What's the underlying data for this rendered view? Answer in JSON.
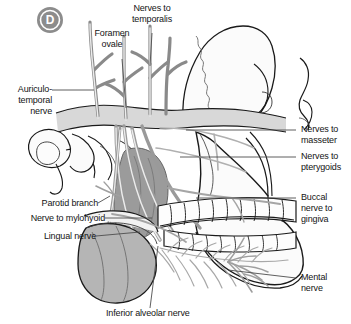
{
  "figure": {
    "panel_letter": "D",
    "panel_badge_color": "#8c8c8c",
    "background": "#ffffff",
    "line_color": "#1a1a1a",
    "leader_color": "#4d4d4d",
    "bone_fill": "#fbfbfb",
    "band_fill": "#d8d8d8",
    "muscle_fill": "#9b9b9b",
    "gland_fill": "#b5b5b5",
    "nerve_fill": "#e6e6e6",
    "nerve_stroke": "#8a8a8a"
  },
  "labels": {
    "nerves_to_temporalis": "Nerves to\ntemporalis",
    "foramen_ovale": "Foramen\novale",
    "auriculotemporal_nerve": "Auriculo-\ntemporal\nnerve",
    "nerves_to_masseter": "Nerves to\nmasseter",
    "nerves_to_pterygoids": "Nerves to\npterygoids",
    "buccal_nerve_to_gingiva": "Buccal\nnerve to\ngingiva",
    "parotid_branch": "Parotid branch",
    "nerve_to_mylohyoid": "Nerve to mylohyoid",
    "lingual_nerve": "Lingual nerve",
    "mental_nerve": "Mental nerve",
    "inferior_alveolar_nerve": "Inferior alveolar nerve"
  }
}
